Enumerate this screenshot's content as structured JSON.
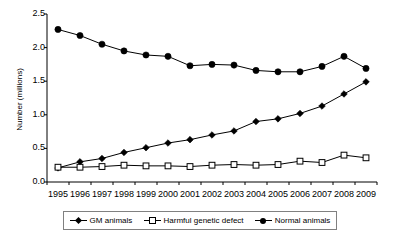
{
  "chart_data": {
    "type": "line",
    "title": "",
    "xlabel": "",
    "ylabel": "Number (millions)",
    "categories": [
      "1995",
      "1996",
      "1997",
      "1998",
      "1999",
      "2000",
      "2001",
      "2002",
      "2003",
      "2004",
      "2005",
      "2006",
      "2007",
      "2008",
      "2009"
    ],
    "ylim": [
      0.0,
      2.5
    ],
    "ytick_labels": [
      "0.0",
      "0.5",
      "1.0",
      "1.5",
      "2.0",
      "2.5"
    ],
    "ytick_values": [
      0.0,
      0.5,
      1.0,
      1.5,
      2.0,
      2.5
    ],
    "grid": false,
    "legend_position": "bottom",
    "series": [
      {
        "name": "GM animals",
        "marker": "filled-diamond",
        "values": [
          0.21,
          0.3,
          0.35,
          0.44,
          0.51,
          0.58,
          0.63,
          0.7,
          0.76,
          0.9,
          0.94,
          1.02,
          1.13,
          1.31,
          1.49
        ]
      },
      {
        "name": "Harmful genetic defect",
        "marker": "open-square",
        "values": [
          0.22,
          0.22,
          0.23,
          0.25,
          0.24,
          0.24,
          0.23,
          0.25,
          0.26,
          0.25,
          0.26,
          0.31,
          0.29,
          0.4,
          0.36
        ]
      },
      {
        "name": "Normal animals",
        "marker": "filled-circle",
        "values": [
          2.27,
          2.18,
          2.05,
          1.95,
          1.89,
          1.87,
          1.73,
          1.75,
          1.74,
          1.66,
          1.64,
          1.64,
          1.72,
          1.87,
          1.69
        ]
      }
    ]
  },
  "colors": {
    "line": "#000000",
    "axis": "#000000",
    "background": "#ffffff",
    "legend_border": "#808080"
  }
}
